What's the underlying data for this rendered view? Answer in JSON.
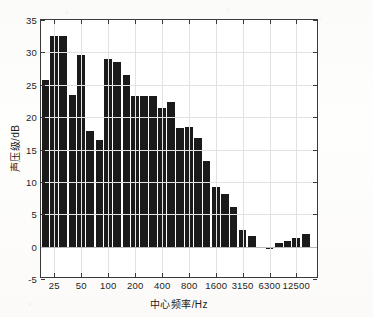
{
  "chart_data": {
    "type": "bar",
    "title": "",
    "xlabel": "中心频率/Hz",
    "ylabel": "声压级/dB",
    "xscale": "log",
    "ylim": [
      -5,
      35
    ],
    "yticks": [
      -5,
      0,
      5,
      10,
      15,
      20,
      25,
      30,
      35
    ],
    "ytick_labels": [
      "-5",
      "0",
      "5",
      "10",
      "15",
      "20",
      "25",
      "30",
      "35"
    ],
    "xticks": [
      25,
      50,
      100,
      200,
      400,
      800,
      1600,
      3150,
      6300,
      12500
    ],
    "xtick_labels": [
      "25",
      "50",
      "100",
      "200",
      "400",
      "800",
      "1600",
      "3150",
      "6300",
      "12500"
    ],
    "xlim": [
      17.8,
      22400
    ],
    "grid": true,
    "legend": null,
    "bar_color": "#1a1a1a",
    "categories": [
      20,
      25,
      31.5,
      40,
      50,
      63,
      80,
      100,
      125,
      160,
      200,
      250,
      315,
      400,
      500,
      630,
      800,
      1000,
      1250,
      1600,
      2000,
      2500,
      3150,
      4000,
      5000,
      6300,
      8000,
      10000,
      12500,
      16000
    ],
    "category_labels": [
      "20",
      "25",
      "31.5",
      "40",
      "50",
      "63",
      "80",
      "100",
      "125",
      "160",
      "200",
      "250",
      "315",
      "400",
      "500",
      "630",
      "800",
      "1000",
      "1250",
      "1600",
      "2000",
      "2500",
      "3150",
      "4000",
      "5000",
      "6300",
      "8000",
      "10000",
      "12500",
      "16000"
    ],
    "values": [
      25.8,
      32.5,
      32.5,
      23.4,
      29.6,
      17.8,
      16.5,
      29.0,
      28.5,
      26.5,
      23.2,
      23.3,
      23.3,
      21.4,
      22.4,
      18.3,
      18.4,
      16.7,
      13.2,
      9.2,
      8.1,
      6.1,
      2.5,
      1.7,
      -0.1,
      -0.3,
      0.5,
      0.9,
      1.3,
      1.9
    ],
    "series_name": "1/3倍频程声压级"
  }
}
